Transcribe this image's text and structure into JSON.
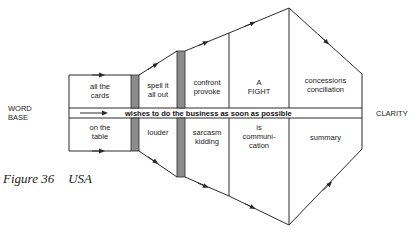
{
  "left_label": "WORD\nBASE",
  "right_label": "CLARITY",
  "band_label": "wishes to do the business as soon as possible",
  "upper_cells": [
    {
      "text": "all the\ncards"
    },
    {
      "text": "spell it\nall out"
    },
    {
      "text": "confront\nprovoke"
    },
    {
      "text": "A\nFIGHT"
    },
    {
      "text": "concessions\nconciliation"
    }
  ],
  "lower_cells": [
    {
      "text": "on the\ntable"
    },
    {
      "text": "louder"
    },
    {
      "text": "sarcasm\nkidding"
    },
    {
      "text": "is\ncommuni-\ncation"
    },
    {
      "text": "summary"
    }
  ],
  "caption": {
    "figure": "Figure 36",
    "title": "USA"
  },
  "colors": {
    "line": "#2a2a2a",
    "bar_fill": "#8c8c8c"
  }
}
